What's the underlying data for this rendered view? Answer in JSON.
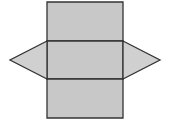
{
  "diagram": {
    "type": "triangular-prism-net",
    "colors": {
      "face_fill": "#c8c8c8",
      "triangle_fill": "#d0d0d0",
      "stroke": "#333333"
    },
    "faces": [
      {
        "name": "top-rectangle",
        "shape": "rectangle",
        "points": [
          [
            47,
            2
          ],
          [
            123,
            2
          ],
          [
            123,
            41
          ],
          [
            47,
            41
          ]
        ]
      },
      {
        "name": "middle-rectangle",
        "shape": "rectangle",
        "points": [
          [
            47,
            41
          ],
          [
            123,
            41
          ],
          [
            123,
            79
          ],
          [
            47,
            79
          ]
        ]
      },
      {
        "name": "bottom-rectangle",
        "shape": "rectangle",
        "points": [
          [
            47,
            79
          ],
          [
            123,
            79
          ],
          [
            123,
            118
          ],
          [
            47,
            118
          ]
        ]
      },
      {
        "name": "left-triangle",
        "shape": "triangle",
        "points": [
          [
            47,
            41
          ],
          [
            10,
            60
          ],
          [
            47,
            79
          ]
        ]
      },
      {
        "name": "right-triangle",
        "shape": "triangle",
        "points": [
          [
            123,
            41
          ],
          [
            160,
            60
          ],
          [
            123,
            79
          ]
        ]
      }
    ]
  }
}
